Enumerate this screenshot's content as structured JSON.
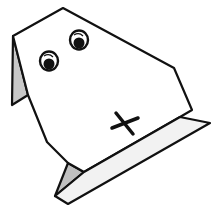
{
  "figure": {
    "caption": "",
    "colors": {
      "background": "#ffffff",
      "paper": "#ffffff",
      "shade_ear": "#c8c8c8",
      "shade_plank": "#f0f0f0",
      "shade_fold": "#c0c0c0",
      "ink": "#111111"
    },
    "parts": {
      "ear": "left-ear-flap",
      "head": "head-panel",
      "eyes": [
        "left-eye",
        "right-eye"
      ],
      "nose": "cross-mark",
      "base": "folded-base-plank"
    }
  }
}
